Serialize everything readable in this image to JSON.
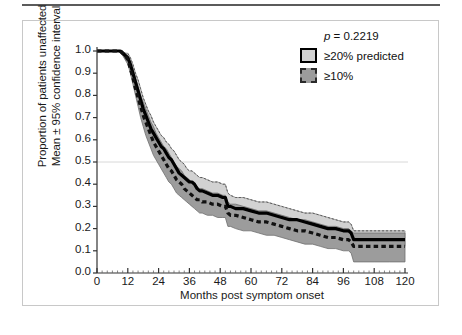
{
  "figure": {
    "background_color": "#ffffff",
    "panel_border_color": "#c8c8c8",
    "top_rule_color": "#5b5b5b"
  },
  "legend": {
    "p_value_prefix": "p",
    "p_value_text": " = 0.2219",
    "entries": [
      {
        "label": "≥20% predicted",
        "swatch": "light-gray-solid-border",
        "fill": "#d2d2d2",
        "border": "#000000",
        "line_style": "solid"
      },
      {
        "label": "≥10%",
        "swatch": "dark-gray-dashed-border",
        "fill": "#9c9c9c",
        "border": "#2a2a2a",
        "line_style": "dashed"
      }
    ]
  },
  "chart_data": {
    "type": "line",
    "title": "",
    "subtitle": "",
    "xlabel": "Months post symptom onset",
    "ylabel": "Proportion of patients unaffected\nMean ± 95% confidence interval",
    "ylabel_line1": "Proportion of patients unaffected",
    "ylabel_line2": "Mean ± 95% confidence interval",
    "xlim": [
      0,
      120
    ],
    "ylim": [
      0.0,
      1.0
    ],
    "xticks": [
      0,
      12,
      24,
      36,
      48,
      60,
      72,
      84,
      96,
      108,
      120
    ],
    "yticks": [
      0.0,
      0.1,
      0.2,
      0.3,
      0.4,
      0.5,
      0.6,
      0.7,
      0.8,
      0.9,
      1.0
    ],
    "ytick_labels": [
      "0.0",
      "0.1",
      "0.2",
      "0.3",
      "0.4",
      "0.5",
      "0.6",
      "0.7",
      "0.8",
      "0.9",
      "1.0"
    ],
    "xtick_labels": [
      "0",
      "12",
      "24",
      "36",
      "48",
      "60",
      "72",
      "84",
      "96",
      "108",
      "120"
    ],
    "grid": false,
    "gridlines_y": [
      0.5
    ],
    "gridline_color": "#d8d8d8",
    "legend_position": "top-right",
    "annotations": [
      {
        "text": "p = 0.2219",
        "x": 96,
        "y": 0.95
      }
    ],
    "series": [
      {
        "name": "≥20% predicted",
        "line_style": "solid",
        "line_color": "#000000",
        "line_width": 3.2,
        "band_color": "#d2d2d2",
        "band_edge_color": "#8a8a8a",
        "x": [
          0,
          6,
          9,
          10,
          11,
          12,
          13,
          14,
          15,
          16,
          17,
          18,
          19,
          20,
          21,
          22,
          23,
          24,
          25,
          26,
          27,
          28,
          29,
          30,
          31,
          32,
          33,
          34,
          35,
          36,
          37,
          38,
          39,
          40,
          41,
          43,
          45,
          47,
          49,
          50,
          51,
          52,
          54,
          57,
          60,
          63,
          66,
          69,
          72,
          75,
          78,
          81,
          84,
          87,
          90,
          93,
          96,
          98,
          99,
          100,
          104,
          108,
          114,
          120
        ],
        "mean": [
          1.0,
          1.0,
          1.0,
          0.99,
          0.98,
          0.97,
          0.94,
          0.9,
          0.86,
          0.82,
          0.78,
          0.74,
          0.71,
          0.68,
          0.65,
          0.63,
          0.61,
          0.59,
          0.57,
          0.56,
          0.54,
          0.52,
          0.51,
          0.49,
          0.47,
          0.45,
          0.44,
          0.43,
          0.42,
          0.41,
          0.41,
          0.4,
          0.38,
          0.37,
          0.37,
          0.36,
          0.35,
          0.35,
          0.34,
          0.34,
          0.3,
          0.3,
          0.29,
          0.29,
          0.28,
          0.27,
          0.27,
          0.26,
          0.25,
          0.24,
          0.24,
          0.23,
          0.22,
          0.21,
          0.2,
          0.2,
          0.19,
          0.19,
          0.18,
          0.15,
          0.15,
          0.15,
          0.15,
          0.15
        ],
        "lower": [
          1.0,
          1.0,
          1.0,
          0.98,
          0.97,
          0.95,
          0.92,
          0.87,
          0.82,
          0.78,
          0.74,
          0.69,
          0.66,
          0.63,
          0.6,
          0.58,
          0.56,
          0.54,
          0.52,
          0.5,
          0.48,
          0.47,
          0.45,
          0.44,
          0.42,
          0.4,
          0.39,
          0.38,
          0.37,
          0.36,
          0.35,
          0.34,
          0.33,
          0.32,
          0.32,
          0.31,
          0.3,
          0.3,
          0.29,
          0.29,
          0.26,
          0.26,
          0.25,
          0.24,
          0.24,
          0.23,
          0.22,
          0.22,
          0.21,
          0.2,
          0.2,
          0.19,
          0.18,
          0.17,
          0.17,
          0.16,
          0.16,
          0.15,
          0.15,
          0.12,
          0.12,
          0.12,
          0.12,
          0.12
        ],
        "upper": [
          1.0,
          1.0,
          1.0,
          1.0,
          0.99,
          0.99,
          0.97,
          0.94,
          0.9,
          0.87,
          0.83,
          0.79,
          0.76,
          0.73,
          0.71,
          0.68,
          0.66,
          0.64,
          0.62,
          0.61,
          0.59,
          0.58,
          0.56,
          0.55,
          0.53,
          0.51,
          0.5,
          0.49,
          0.47,
          0.46,
          0.46,
          0.45,
          0.44,
          0.43,
          0.43,
          0.42,
          0.41,
          0.41,
          0.4,
          0.4,
          0.36,
          0.35,
          0.34,
          0.34,
          0.33,
          0.32,
          0.32,
          0.31,
          0.3,
          0.29,
          0.28,
          0.27,
          0.27,
          0.26,
          0.25,
          0.24,
          0.23,
          0.23,
          0.22,
          0.19,
          0.19,
          0.19,
          0.19,
          0.19
        ]
      },
      {
        "name": "≥10%",
        "line_style": "dashed",
        "line_color": "#111111",
        "line_width": 3.2,
        "band_color": "#9c9c9c",
        "band_edge_color": "#6e6e6e",
        "x": [
          0,
          6,
          9,
          10,
          11,
          12,
          13,
          14,
          15,
          16,
          17,
          18,
          19,
          20,
          21,
          22,
          23,
          24,
          25,
          26,
          27,
          28,
          29,
          30,
          31,
          32,
          33,
          34,
          35,
          36,
          37,
          38,
          39,
          40,
          41,
          43,
          45,
          47,
          49,
          50,
          51,
          52,
          54,
          57,
          60,
          63,
          66,
          69,
          72,
          75,
          78,
          81,
          84,
          87,
          90,
          93,
          96,
          98,
          99,
          100,
          104,
          108,
          114,
          120
        ],
        "mean": [
          1.0,
          1.0,
          1.0,
          0.99,
          0.98,
          0.96,
          0.92,
          0.88,
          0.83,
          0.79,
          0.75,
          0.71,
          0.68,
          0.65,
          0.62,
          0.59,
          0.57,
          0.55,
          0.53,
          0.51,
          0.49,
          0.47,
          0.46,
          0.44,
          0.42,
          0.41,
          0.4,
          0.38,
          0.37,
          0.36,
          0.35,
          0.34,
          0.33,
          0.33,
          0.32,
          0.32,
          0.31,
          0.31,
          0.3,
          0.3,
          0.27,
          0.26,
          0.26,
          0.25,
          0.24,
          0.23,
          0.23,
          0.22,
          0.21,
          0.2,
          0.19,
          0.19,
          0.18,
          0.17,
          0.16,
          0.16,
          0.15,
          0.15,
          0.14,
          0.12,
          0.12,
          0.12,
          0.12,
          0.12
        ],
        "lower": [
          1.0,
          1.0,
          1.0,
          0.98,
          0.96,
          0.94,
          0.9,
          0.85,
          0.8,
          0.75,
          0.7,
          0.66,
          0.62,
          0.59,
          0.56,
          0.53,
          0.51,
          0.49,
          0.47,
          0.45,
          0.43,
          0.41,
          0.4,
          0.38,
          0.36,
          0.35,
          0.34,
          0.33,
          0.32,
          0.31,
          0.3,
          0.29,
          0.28,
          0.27,
          0.27,
          0.26,
          0.26,
          0.25,
          0.25,
          0.25,
          0.21,
          0.21,
          0.2,
          0.19,
          0.19,
          0.18,
          0.17,
          0.17,
          0.16,
          0.15,
          0.14,
          0.13,
          0.13,
          0.12,
          0.11,
          0.11,
          0.1,
          0.1,
          0.09,
          0.05,
          0.05,
          0.05,
          0.05,
          0.05
        ],
        "upper": [
          1.0,
          1.0,
          1.0,
          1.0,
          0.99,
          0.98,
          0.95,
          0.92,
          0.88,
          0.84,
          0.8,
          0.77,
          0.74,
          0.71,
          0.68,
          0.66,
          0.63,
          0.61,
          0.59,
          0.57,
          0.56,
          0.54,
          0.52,
          0.5,
          0.48,
          0.47,
          0.46,
          0.44,
          0.43,
          0.42,
          0.41,
          0.4,
          0.39,
          0.38,
          0.38,
          0.37,
          0.36,
          0.36,
          0.35,
          0.35,
          0.32,
          0.31,
          0.31,
          0.3,
          0.29,
          0.28,
          0.28,
          0.27,
          0.26,
          0.25,
          0.24,
          0.24,
          0.23,
          0.22,
          0.21,
          0.21,
          0.2,
          0.2,
          0.19,
          0.18,
          0.18,
          0.18,
          0.18,
          0.18
        ]
      }
    ]
  }
}
